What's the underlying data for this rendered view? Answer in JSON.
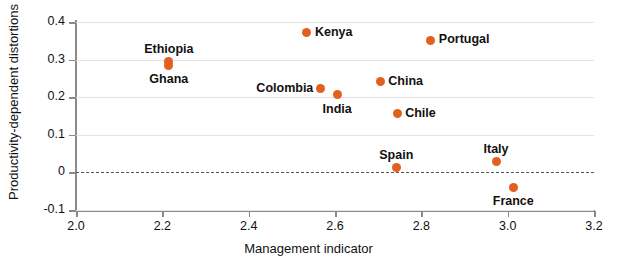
{
  "chart_data": {
    "type": "scatter",
    "title": "",
    "xlabel": "Management indicator",
    "ylabel": "Productivity-dependent distortions",
    "xlim": [
      2.0,
      3.2
    ],
    "ylim": [
      -0.1,
      0.4
    ],
    "xticks": [
      "2.0",
      "2.2",
      "2.4",
      "2.6",
      "2.8",
      "3.0",
      "3.2"
    ],
    "xtick_values": [
      2.0,
      2.2,
      2.4,
      2.6,
      2.8,
      3.0,
      3.2
    ],
    "yticks": [
      "0.4",
      "0.3",
      "0.2",
      "0.1",
      "0",
      "-0.1"
    ],
    "ytick_values": [
      0.4,
      0.3,
      0.2,
      0.1,
      0,
      -0.1
    ],
    "grid": "horizontal",
    "zero_line": true,
    "zero_line_style": "dashed",
    "legend": "none",
    "marker_color": "#e2601f",
    "points": [
      {
        "label": "Ethiopia",
        "x": 2.215,
        "y": 0.295,
        "label_pos": "above"
      },
      {
        "label": "Ghana",
        "x": 2.215,
        "y": 0.285,
        "label_pos": "below"
      },
      {
        "label": "Kenya",
        "x": 2.535,
        "y": 0.371,
        "label_pos": "right"
      },
      {
        "label": "Portugal",
        "x": 2.822,
        "y": 0.352,
        "label_pos": "right"
      },
      {
        "label": "Colombia",
        "x": 2.566,
        "y": 0.223,
        "label_pos": "left"
      },
      {
        "label": "India",
        "x": 2.605,
        "y": 0.206,
        "label_pos": "below"
      },
      {
        "label": "China",
        "x": 2.705,
        "y": 0.241,
        "label_pos": "right"
      },
      {
        "label": "Chile",
        "x": 2.744,
        "y": 0.156,
        "label_pos": "right"
      },
      {
        "label": "Spain",
        "x": 2.742,
        "y": 0.014,
        "label_pos": "above"
      },
      {
        "label": "Italy",
        "x": 2.973,
        "y": 0.029,
        "label_pos": "above"
      },
      {
        "label": "France",
        "x": 3.013,
        "y": -0.039,
        "label_pos": "below"
      }
    ]
  },
  "axes": {
    "x_title": "Management indicator",
    "y_title": "Productivity-dependent distortions"
  }
}
